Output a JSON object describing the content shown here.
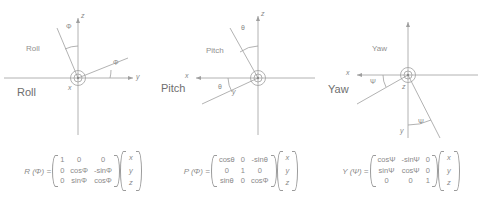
{
  "figure": {
    "title_roll": "Roll",
    "title_pitch": "Pitch",
    "title_yaw": "Yaw",
    "line_color": "#9a9a9a",
    "text_color": "#8a8a8a"
  },
  "panels": [
    {
      "id": "roll",
      "name_small": "Roll",
      "name_large": "Roll",
      "angle_symbol": "Φ",
      "axes": [
        {
          "label": "z",
          "direction": "up"
        },
        {
          "label": "y",
          "direction": "right"
        },
        {
          "label": "x",
          "direction": "out-of-page"
        }
      ],
      "angle_labels": [
        "Φ",
        "Φ"
      ],
      "center_marker": "circle-dot"
    },
    {
      "id": "pitch",
      "name_small": "Pitch",
      "name_large": "Pitch",
      "angle_symbol": "θ",
      "axes": [
        {
          "label": "z",
          "direction": "up"
        },
        {
          "label": "x",
          "direction": "left"
        },
        {
          "label": "y",
          "direction": "out-of-page"
        }
      ],
      "angle_labels": [
        "θ",
        "θ"
      ],
      "center_marker": "circle-dot"
    },
    {
      "id": "yaw",
      "name_small": "Yaw",
      "name_large": "Yaw",
      "angle_symbol": "Ψ",
      "axes": [
        {
          "label": "x",
          "direction": "left"
        },
        {
          "label": "y",
          "direction": "down"
        },
        {
          "label": "z",
          "direction": "out-of-page"
        }
      ],
      "angle_labels": [
        "Ψ",
        "Ψ"
      ],
      "center_marker": "circle-dot"
    }
  ],
  "formulas": [
    {
      "id": "roll-matrix",
      "name": "R (Φ) =",
      "matrix": [
        [
          "1",
          "0",
          "0"
        ],
        [
          "0",
          "cosΦ",
          "-sinΦ"
        ],
        [
          "0",
          "sinΦ",
          "cosΦ"
        ]
      ],
      "vector": [
        "x",
        "y",
        "z"
      ]
    },
    {
      "id": "pitch-matrix",
      "name": "P (Φ) =",
      "matrix": [
        [
          "cosθ",
          "0",
          "-sinθ"
        ],
        [
          "0",
          "1",
          "0"
        ],
        [
          "sinθ",
          "0",
          "cosΦ"
        ]
      ],
      "vector": [
        "x",
        "y",
        "z"
      ]
    },
    {
      "id": "yaw-matrix",
      "name": "Y (Ψ) =",
      "matrix": [
        [
          "cosΨ",
          "-sinΨ",
          "0"
        ],
        [
          "sinΨ",
          "cosΨ",
          "0"
        ],
        [
          "0",
          "0",
          "1"
        ]
      ],
      "vector": [
        "x",
        "y",
        "z"
      ]
    }
  ]
}
